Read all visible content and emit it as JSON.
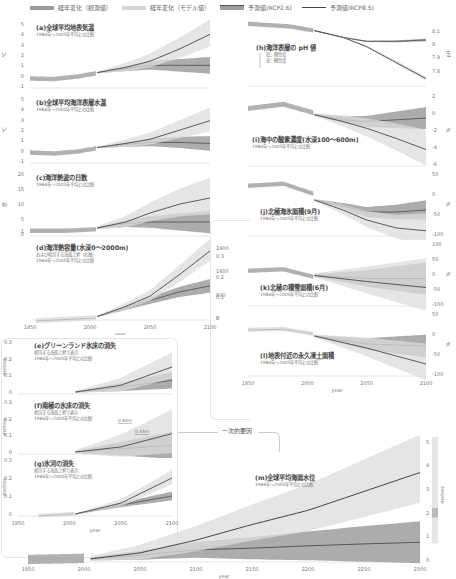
{
  "legend": [
    {
      "label": "経年変化（観測値）",
      "color": "#8c8c8c",
      "type": "band"
    },
    {
      "label": "経年変化（モデル値）",
      "color": "#cccccc",
      "type": "band"
    },
    {
      "label": "予測値(RCP2.6)",
      "color": "#6a6a6a",
      "type": "band-line"
    },
    {
      "label": "予測値(RCP8.5)",
      "color": "#4a4a4a",
      "type": "line"
    }
  ],
  "colors": {
    "obs": "#9a9a9a",
    "model": "#d8d8d8",
    "rcp26_band": "#9d9d9d",
    "rcp85_band": "#dcdcdc",
    "rcp26_line": "#555555",
    "rcp85_line": "#444444",
    "axis": "#cccccc"
  },
  "panels": {
    "a": {
      "title": "(a)全球平均地表気温",
      "subtitle": "1986年～2005年平均との比較",
      "unit": "℃"
    },
    "b": {
      "title": "(b)全球平均海洋表層水温",
      "subtitle": "1986年～2005年平均との比較",
      "unit": "℃"
    },
    "c": {
      "title": "(c)海洋熱波の日数",
      "subtitle": "1986年～2005年平均との比較",
      "unit": "倍"
    },
    "d": {
      "title": "(d)海洋熱容量(水深0～2000m)",
      "subtitle1": "および相当する海面上昇（右軸）",
      "subtitle2": "1986年～2005年平均との比較",
      "unit_left": "10²¹ Joules",
      "unit_right": "metres"
    },
    "e": {
      "title": "(e)グリーンランド氷床の消失",
      "subtitle1": "相当する海面上昇で表示",
      "subtitle2": "1986年～2005年平均との比較",
      "unit": "metres"
    },
    "f": {
      "title": "(f)南極の氷床の消失",
      "subtitle1": "相当する海面上昇で表示",
      "subtitle2": "1986年～2005年平均との比較",
      "unit": "metres"
    },
    "g": {
      "title": "(g)氷河の消失",
      "subtitle1": "相当する海面上昇で表示",
      "subtitle2": "1986年～2005年平均との比較",
      "unit": "metres"
    },
    "h": {
      "title": "(h)海洋表層の pH 値",
      "note_low": "低：酸性度",
      "note_high": "高：酸性度",
      "unit": "pH"
    },
    "i": {
      "title": "(i)海中の酸素濃度(水深100～600m)",
      "subtitle": "1986年～2005年平均との比較",
      "unit": "%"
    },
    "j": {
      "title": "(j)北極海氷面積(9月)",
      "subtitle": "1986年～2005年平均との比較",
      "unit": "%"
    },
    "k": {
      "title": "(k)北極の積雪面積(6月)",
      "subtitle": "1986年～2005年平均との比較",
      "unit": "%"
    },
    "l": {
      "title": "(l)地表付近の永久凍土面積",
      "subtitle": "1986年～2005年平均との比較",
      "unit": "%"
    },
    "m": {
      "title": "(m)全球平均海面水位",
      "subtitle": "1986年～2005年平均との比較",
      "unit": "metres",
      "label_084": "0.84m",
      "label_043": "0.43m"
    }
  },
  "connector_label": "一次的要因",
  "xlabel": "year",
  "chart_data": [
    {
      "id": "a",
      "type": "line",
      "title": "(a)全球平均地表気温",
      "ylabel": "℃",
      "xlabel": "year",
      "xlim": [
        1950,
        2100
      ],
      "ylim": [
        -1,
        5
      ],
      "yticks": [
        -1,
        0,
        1,
        2,
        3,
        4,
        5
      ],
      "series": [
        {
          "name": "経年変化（観測値）",
          "x": [
            1950,
            1970,
            1990,
            2005
          ],
          "values": [
            -0.3,
            -0.35,
            -0.1,
            0.2
          ]
        },
        {
          "name": "予測値(RCP2.6)",
          "x": [
            2006,
            2030,
            2050,
            2075,
            2100
          ],
          "values": [
            0.3,
            0.7,
            1.0,
            1.0,
            1.0
          ]
        },
        {
          "name": "予測値(RCP8.5)",
          "x": [
            2006,
            2030,
            2050,
            2075,
            2100
          ],
          "values": [
            0.3,
            0.8,
            1.4,
            2.6,
            4.0
          ]
        }
      ]
    },
    {
      "id": "b",
      "type": "line",
      "title": "(b)全球平均海洋表層水温",
      "ylabel": "℃",
      "xlabel": "year",
      "xlim": [
        1950,
        2100
      ],
      "ylim": [
        -1,
        5
      ],
      "yticks": [
        -1,
        0,
        1,
        2,
        3,
        4,
        5
      ],
      "series": [
        {
          "name": "経年変化（観測値）",
          "x": [
            1950,
            1970,
            1990,
            2005
          ],
          "values": [
            -0.2,
            -0.3,
            -0.1,
            0.2
          ]
        },
        {
          "name": "予測値(RCP2.6)",
          "x": [
            2006,
            2030,
            2050,
            2075,
            2100
          ],
          "values": [
            0.3,
            0.6,
            0.8,
            0.8,
            0.7
          ]
        },
        {
          "name": "予測値(RCP8.5)",
          "x": [
            2006,
            2030,
            2050,
            2075,
            2100
          ],
          "values": [
            0.3,
            0.7,
            1.1,
            2.0,
            2.9
          ]
        }
      ]
    },
    {
      "id": "c",
      "type": "line",
      "title": "(c)海洋熱波の日数",
      "ylabel": "倍",
      "xlabel": "year",
      "xlim": [
        1950,
        2100
      ],
      "ylim": [
        0,
        20
      ],
      "yticks": [
        0,
        1,
        5,
        10,
        15,
        20
      ],
      "series": [
        {
          "name": "経年変化（観測値）",
          "x": [
            1950,
            1980,
            2005
          ],
          "values": [
            1,
            1,
            1.5
          ]
        },
        {
          "name": "予測値(RCP2.6)",
          "x": [
            2006,
            2030,
            2050,
            2075,
            2100
          ],
          "values": [
            2,
            3.5,
            4,
            4,
            4
          ]
        },
        {
          "name": "予測値(RCP8.5)",
          "x": [
            2006,
            2030,
            2050,
            2075,
            2100
          ],
          "values": [
            2,
            4,
            7,
            10,
            12
          ]
        }
      ]
    },
    {
      "id": "d",
      "type": "line",
      "title": "(d)海洋熱容量(水深0～2000m)",
      "ylabel": "10²¹ Joules",
      "ylabel_right": "metres",
      "xlabel": "year",
      "xlim": [
        1950,
        2100
      ],
      "ylim": [
        0,
        2400
      ],
      "yticks": [
        0,
        800,
        1600,
        2400
      ],
      "yticks_right": [
        0,
        0.1,
        0.2,
        0.3
      ],
      "xticks": [
        1950,
        2000,
        2050,
        2100
      ],
      "series": [
        {
          "name": "経年変化（モデル値）",
          "x": [
            1955,
            1980,
            2005
          ],
          "values": [
            -100,
            -50,
            0
          ]
        },
        {
          "name": "予測値(RCP2.6)",
          "x": [
            2006,
            2030,
            2050,
            2075,
            2100
          ],
          "values": [
            50,
            350,
            600,
            900,
            1100
          ]
        },
        {
          "name": "予測値(RCP8.5)",
          "x": [
            2006,
            2030,
            2050,
            2075,
            2100
          ],
          "values": [
            50,
            400,
            750,
            1500,
            2300
          ]
        }
      ]
    },
    {
      "id": "e",
      "type": "line",
      "title": "(e)グリーンランド氷床の消失",
      "ylabel": "metres",
      "xlim": [
        1950,
        2100
      ],
      "ylim": [
        0,
        0.3
      ],
      "yticks": [
        0,
        0.1,
        0.2,
        0.3
      ],
      "series": [
        {
          "name": "予測値(RCP2.6)",
          "x": [
            2006,
            2050,
            2100
          ],
          "values": [
            0,
            0.03,
            0.07
          ]
        },
        {
          "name": "予測値(RCP8.5)",
          "x": [
            2006,
            2050,
            2100
          ],
          "values": [
            0,
            0.04,
            0.15
          ]
        }
      ]
    },
    {
      "id": "f",
      "type": "line",
      "title": "(f)南極の氷床の消失",
      "ylabel": "metres",
      "xlim": [
        1950,
        2100
      ],
      "ylim": [
        0,
        0.3
      ],
      "yticks": [
        0,
        0.1,
        0.2,
        0.3
      ],
      "series": [
        {
          "name": "予測値(RCP2.6)",
          "x": [
            2006,
            2050,
            2100
          ],
          "values": [
            0,
            0.02,
            0.04
          ]
        },
        {
          "name": "予測値(RCP8.5)",
          "x": [
            2006,
            2050,
            2100
          ],
          "values": [
            0,
            0.03,
            0.11
          ]
        }
      ]
    },
    {
      "id": "g",
      "type": "line",
      "title": "(g)氷河の消失",
      "ylabel": "metres",
      "xlabel": "year",
      "xlim": [
        1950,
        2100
      ],
      "ylim": [
        0,
        0.3
      ],
      "yticks": [
        0,
        0.1,
        0.2,
        0.3
      ],
      "xticks": [
        1950,
        2000,
        2050,
        2100
      ],
      "series": [
        {
          "name": "経年変化（モデル値）",
          "x": [
            1970,
            2005
          ],
          "values": [
            -0.01,
            0
          ]
        },
        {
          "name": "予測値(RCP2.6)",
          "x": [
            2006,
            2050,
            2100
          ],
          "values": [
            0,
            0.05,
            0.1
          ]
        },
        {
          "name": "予測値(RCP8.5)",
          "x": [
            2006,
            2050,
            2100
          ],
          "values": [
            0,
            0.06,
            0.2
          ]
        }
      ]
    },
    {
      "id": "h",
      "type": "line",
      "title": "(h)海洋表層の pH 値",
      "ylabel": "pH",
      "xlim": [
        1950,
        2100
      ],
      "ylim": [
        7.7,
        8.15
      ],
      "yticks": [
        7.8,
        7.9,
        8.0,
        8.1
      ],
      "series": [
        {
          "name": "経年変化（観測値）",
          "x": [
            1950,
            1985,
            2005
          ],
          "values": [
            8.15,
            8.13,
            8.1
          ]
        },
        {
          "name": "予測値(RCP2.6)",
          "x": [
            2006,
            2030,
            2050,
            2075,
            2100
          ],
          "values": [
            8.1,
            8.05,
            8.02,
            8.02,
            8.03
          ]
        },
        {
          "name": "予測値(RCP8.5)",
          "x": [
            2006,
            2030,
            2050,
            2075,
            2100
          ],
          "values": [
            8.1,
            8.05,
            7.98,
            7.86,
            7.74
          ]
        }
      ]
    },
    {
      "id": "i",
      "type": "line",
      "title": "(i)海中の酸素濃度(水深100～600m)",
      "ylabel": "%",
      "xlim": [
        1950,
        2100
      ],
      "ylim": [
        -6,
        2
      ],
      "yticks": [
        -6,
        -4,
        -2,
        0,
        2
      ],
      "series": [
        {
          "name": "経年変化（観測値）",
          "x": [
            1950,
            1980,
            2005
          ],
          "values": [
            0.5,
            1,
            0
          ]
        },
        {
          "name": "予測値(RCP2.6)",
          "x": [
            2006,
            2030,
            2050,
            2075,
            2100
          ],
          "values": [
            -0.2,
            -0.8,
            -1.0,
            -0.8,
            -0.6
          ]
        },
        {
          "name": "予測値(RCP8.5)",
          "x": [
            2006,
            2030,
            2050,
            2075,
            2100
          ],
          "values": [
            -0.2,
            -1.0,
            -1.8,
            -3.0,
            -4.3
          ]
        }
      ]
    },
    {
      "id": "j",
      "type": "line",
      "title": "(j)北極海氷面積(9月)",
      "ylabel": "%",
      "xlim": [
        1950,
        2100
      ],
      "ylim": [
        -100,
        50
      ],
      "yticks": [
        -100,
        -50,
        0,
        50
      ],
      "series": [
        {
          "name": "経年変化（観測値）",
          "x": [
            1950,
            1980,
            2005
          ],
          "values": [
            20,
            25,
            0
          ]
        },
        {
          "name": "予測値(RCP2.6)",
          "x": [
            2006,
            2030,
            2050,
            2075,
            2100
          ],
          "values": [
            -15,
            -30,
            -45,
            -45,
            -40
          ]
        },
        {
          "name": "予測値(RCP8.5)",
          "x": [
            2006,
            2030,
            2050,
            2075,
            2100
          ],
          "values": [
            -15,
            -40,
            -65,
            -85,
            -92
          ]
        }
      ]
    },
    {
      "id": "k",
      "type": "line",
      "title": "(k)北極の積雪面積(6月)",
      "ylabel": "%",
      "xlim": [
        1950,
        2100
      ],
      "ylim": [
        -100,
        100
      ],
      "yticks": [
        -100,
        -50,
        0,
        50,
        100
      ],
      "series": [
        {
          "name": "経年変化（観測値）",
          "x": [
            1950,
            1980,
            2005
          ],
          "values": [
            10,
            15,
            -10
          ]
        },
        {
          "name": "予測値(RCP2.6)",
          "x": [
            2006,
            2050,
            2100
          ],
          "values": [
            -5,
            -15,
            -15
          ]
        },
        {
          "name": "予測値(RCP8.5)",
          "x": [
            2006,
            2050,
            2100
          ],
          "values": [
            -5,
            -25,
            -45
          ]
        }
      ]
    },
    {
      "id": "l",
      "type": "line",
      "title": "(l)地表付近の永久凍土面積",
      "ylabel": "%",
      "xlabel": "year",
      "xlim": [
        1950,
        2100
      ],
      "ylim": [
        -100,
        50
      ],
      "yticks": [
        -100,
        -50,
        0,
        50
      ],
      "xticks": [
        1950,
        2000,
        2050,
        2100
      ],
      "series": [
        {
          "name": "経年変化（モデル値）",
          "x": [
            1950,
            1980,
            2005
          ],
          "values": [
            10,
            12,
            0
          ]
        },
        {
          "name": "予測値(RCP2.6)",
          "x": [
            2006,
            2050,
            2100
          ],
          "values": [
            -5,
            -25,
            -30
          ]
        },
        {
          "name": "予測値(RCP8.5)",
          "x": [
            2006,
            2050,
            2100
          ],
          "values": [
            -5,
            -35,
            -75
          ]
        }
      ]
    },
    {
      "id": "m",
      "type": "line",
      "title": "(m)全球平均海面水位",
      "ylabel": "metres",
      "xlabel": "year",
      "xlim": [
        1950,
        2300
      ],
      "ylim": [
        0,
        5.5
      ],
      "yticks": [
        0,
        1,
        2,
        3,
        4,
        5
      ],
      "xticks": [
        1950,
        2000,
        2050,
        2100,
        2150,
        2200,
        2250,
        2300
      ],
      "annotations": [
        "0.84m",
        "0.43m"
      ],
      "series": [
        {
          "name": "経年変化（観測値）",
          "x": [
            1950,
            2000
          ],
          "values": [
            0,
            0.05
          ]
        },
        {
          "name": "予測値(RCP2.6)",
          "x": [
            2006,
            2050,
            2100,
            2150,
            2200,
            2250,
            2300
          ],
          "values": [
            0.05,
            0.2,
            0.43,
            0.5,
            0.6,
            0.68,
            0.75
          ]
        },
        {
          "name": "予測値(RCP8.5)",
          "x": [
            2006,
            2050,
            2100,
            2150,
            2200,
            2250,
            2300
          ],
          "values": [
            0.05,
            0.3,
            0.84,
            1.5,
            2.1,
            2.9,
            3.7
          ]
        }
      ]
    }
  ]
}
